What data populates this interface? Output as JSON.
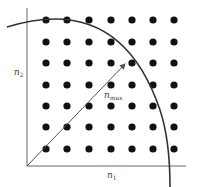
{
  "diagram": {
    "title": "",
    "labels": {
      "y_axis": {
        "base": "n",
        "sub": "2"
      },
      "x_axis": {
        "base": "n",
        "sub": "1"
      },
      "vector": {
        "base": "n",
        "sub": "max"
      }
    },
    "grid": {
      "columns": 7,
      "rows": 7,
      "x_positions": [
        46,
        67,
        89,
        111,
        132,
        153,
        174
      ],
      "y_positions": [
        20,
        42,
        63,
        85,
        106,
        127,
        149
      ],
      "dot_radius": 3.6
    },
    "axes": {
      "origin": [
        27,
        166
      ],
      "y_top": 8,
      "x_right": 186
    },
    "arc": {
      "path": "M 7 27 Q 120 -8 160 110 Q 170 140 170 187"
    },
    "vector_arrow": {
      "from": [
        27,
        166
      ],
      "to": [
        125,
        64
      ]
    },
    "colors": {
      "dot": "#111111",
      "axis": "#666666",
      "arc": "#333333",
      "arrow": "#555555"
    }
  }
}
